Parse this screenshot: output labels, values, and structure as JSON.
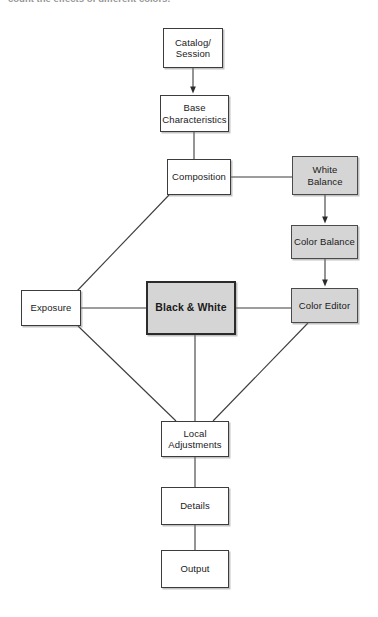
{
  "page": {
    "partial_caption": "count the effects of different colors.",
    "background_color": "#ffffff"
  },
  "diagram": {
    "type": "flowchart",
    "shaded_fill": "#d5d5d5",
    "plain_fill": "#ffffff",
    "line_color": "#3c3c3c",
    "nodes": [
      {
        "id": "catalog",
        "label": "Catalog/\nSession",
        "style": "plain",
        "x": 163,
        "y": 28,
        "w": 60,
        "h": 40
      },
      {
        "id": "base",
        "label": "Base\nCharacteristics",
        "style": "plain",
        "x": 160,
        "y": 95,
        "w": 69,
        "h": 37
      },
      {
        "id": "composition",
        "label": "Composition",
        "style": "plain",
        "x": 167,
        "y": 159,
        "w": 64,
        "h": 36
      },
      {
        "id": "white",
        "label": "White\nBalance",
        "style": "shaded",
        "x": 292,
        "y": 156,
        "w": 66,
        "h": 39
      },
      {
        "id": "colorbal",
        "label": "Color Balance",
        "style": "shaded",
        "x": 291,
        "y": 225,
        "w": 67,
        "h": 34
      },
      {
        "id": "exposure",
        "label": "Exposure",
        "style": "plain",
        "x": 21,
        "y": 290,
        "w": 60,
        "h": 36
      },
      {
        "id": "bw",
        "label": "Black & White",
        "style": "emphasis",
        "x": 146,
        "y": 281,
        "w": 90,
        "h": 54
      },
      {
        "id": "coloredit",
        "label": "Color Editor",
        "style": "shaded",
        "x": 291,
        "y": 288,
        "w": 67,
        "h": 35
      },
      {
        "id": "local",
        "label": "Local\nAdjustments",
        "style": "plain",
        "x": 161,
        "y": 421,
        "w": 68,
        "h": 36
      },
      {
        "id": "details",
        "label": "Details",
        "style": "plain",
        "x": 161,
        "y": 487,
        "w": 68,
        "h": 38
      },
      {
        "id": "output",
        "label": "Output",
        "style": "plain",
        "x": 161,
        "y": 550,
        "w": 68,
        "h": 38
      }
    ],
    "edges": [
      {
        "from": "catalog",
        "to": "base",
        "kind": "arrow",
        "shape": "vertical"
      },
      {
        "from": "base",
        "to": "composition",
        "kind": "plain",
        "shape": "vertical"
      },
      {
        "from": "composition",
        "to": "white",
        "kind": "plain",
        "shape": "horizontal"
      },
      {
        "from": "white",
        "to": "colorbal",
        "kind": "arrow",
        "shape": "vertical"
      },
      {
        "from": "colorbal",
        "to": "coloredit",
        "kind": "arrow",
        "shape": "vertical"
      },
      {
        "from": "composition",
        "to": "exposure",
        "kind": "plain",
        "shape": "diagonal"
      },
      {
        "from": "exposure",
        "to": "bw",
        "kind": "plain",
        "shape": "horizontal"
      },
      {
        "from": "bw",
        "to": "coloredit",
        "kind": "plain",
        "shape": "horizontal"
      },
      {
        "from": "exposure",
        "to": "local",
        "kind": "plain",
        "shape": "diagonal"
      },
      {
        "from": "bw",
        "to": "local",
        "kind": "plain",
        "shape": "vertical"
      },
      {
        "from": "coloredit",
        "to": "local",
        "kind": "plain",
        "shape": "diagonal"
      },
      {
        "from": "local",
        "to": "details",
        "kind": "plain",
        "shape": "vertical"
      },
      {
        "from": "details",
        "to": "output",
        "kind": "plain",
        "shape": "vertical"
      }
    ]
  }
}
